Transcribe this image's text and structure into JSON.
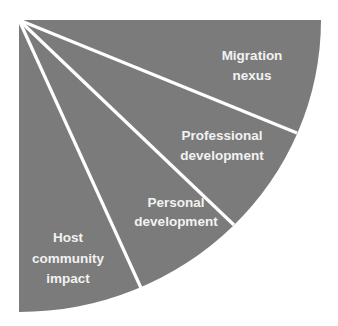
{
  "diagram": {
    "type": "quarter-fan",
    "colors": {
      "background": "#ffffff",
      "fill": "#7b7b7b",
      "divider": "#ffffff",
      "text": "#f2f2f2"
    },
    "segments": [
      {
        "id": "migration-nexus",
        "lines": [
          "Migration",
          "nexus"
        ]
      },
      {
        "id": "professional-development",
        "lines": [
          "Professional",
          "development"
        ]
      },
      {
        "id": "personal-development",
        "lines": [
          "Personal",
          "development"
        ]
      },
      {
        "id": "host-community-impact",
        "lines": [
          "Host",
          "community",
          "impact"
        ]
      }
    ]
  }
}
